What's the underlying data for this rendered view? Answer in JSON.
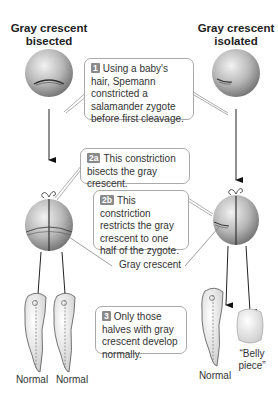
{
  "columns": {
    "left_title": [
      "Gray crescent",
      "bisected"
    ],
    "right_title": [
      "Gray crescent",
      "isolated"
    ]
  },
  "steps": [
    {
      "badge": "1",
      "text": "Using a baby's hair, Spemann constricted a salamander zygote before first cleavage."
    },
    {
      "badge": "2a",
      "text": "This constriction bisects the gray crescent."
    },
    {
      "badge": "2b",
      "text": "This constriction restricts the gray crescent to one half of the zygote."
    },
    {
      "badge": "3",
      "text": "Only those halves with gray crescent develop normally."
    }
  ],
  "labels": {
    "gray_crescent": "Gray crescent",
    "outcomes": [
      "Normal",
      "Normal",
      "Normal",
      "“Belly piece”"
    ]
  },
  "colors": {
    "badge": "#8a8a8a",
    "callout_border": "#aaaaaa",
    "sphere_light": "#e8e8e8",
    "sphere_dark": "#7a7a7a"
  }
}
